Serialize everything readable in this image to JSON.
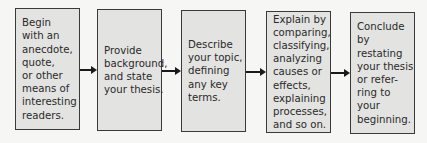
{
  "diagram": {
    "type": "flowchart",
    "steps": [
      {
        "text": "Begin\nwith an\nanecdote,\nquote,\nor other\nmeans of\ninteresting\nreaders."
      },
      {
        "text": "Provide\nbackground,\nand state\nyour thesis."
      },
      {
        "text": "Describe\nyour topic,\ndefining\nany key\nterms."
      },
      {
        "text": "Explain by\ncomparing,\nclassifying,\nanalyzing\ncauses or\neffects,\nexplaining\nprocesses,\nand so on."
      },
      {
        "text": "Conclude\nby restating\nyour thesis\nor refer-\nring to your\nbeginning."
      }
    ],
    "connectors": [
      "arrow-right",
      "arrow-right",
      "arrow-right",
      "arrow-right"
    ]
  }
}
